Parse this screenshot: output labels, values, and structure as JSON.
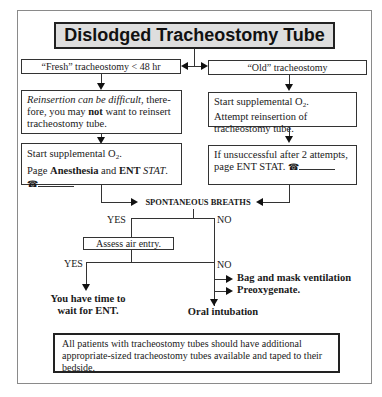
{
  "title": "Dislodged Tracheostomy Tube",
  "left_branch": {
    "header": "“Fresh” tracheostomy < 48 hr",
    "step1": {
      "italic": "Reinsertion can be difficult",
      "rest1": ", there-fore, you may ",
      "bold": "not",
      "rest2": " want to reinsert tracheostomy tube."
    },
    "step2": {
      "line1_prefix": "Start supplemental O",
      "line1_sub": "2",
      "line1_suffix": ".",
      "line2_a": "Page ",
      "line2_bold1": "Anesthesia",
      "line2_b": " and ",
      "line2_bold2": "ENT",
      "line2_italic": " STAT",
      "line2_end": ".",
      "phone_icon": "☎"
    }
  },
  "right_branch": {
    "header": "“Old” tracheostomy",
    "step1": {
      "line1_prefix": "Start supplemental O",
      "line1_sub": "2",
      "line1_suffix": ".",
      "rest": "Attempt reinsertion of tracheostomy tube."
    },
    "step2": {
      "text": "If unsuccessful after 2 attempts, page ENT STAT. ",
      "phone_icon": "☎"
    }
  },
  "decision1": {
    "label": "SPONTANEOUS BREATHS",
    "yes": "YES",
    "no": "NO"
  },
  "decision2": {
    "label": "Assess air entry.",
    "yes": "YES",
    "no": "NO"
  },
  "outcomes": {
    "yes_line1": "You have time to",
    "yes_line2": "wait for ENT.",
    "no_bag": "Bag and mask ventilation",
    "no_preox": "Preoxygenate.",
    "no_final": "Oral intubation"
  },
  "note": "All patients with tracheostomy tubes should have additional appropriate-sized tracheostomy tubes available and taped to their bedside."
}
